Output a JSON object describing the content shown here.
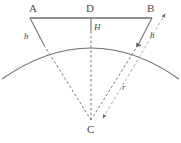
{
  "figure": {
    "type": "geometry-diagram",
    "background_color": "#ffffff",
    "stroke_color": "#6f6f6f",
    "chord_color": "#8a8a8a",
    "dashed_color": "#7a7a7a",
    "radius_arrow_color": "#a9a9a9",
    "text_color": "#4a4a4a"
  },
  "labels": {
    "a": {
      "text": "A",
      "role": "chord-left-endpoint",
      "x": 29,
      "y": 3,
      "style": "upright"
    },
    "d": {
      "text": "D",
      "role": "chord-midpoint",
      "x": 86,
      "y": 3,
      "style": "upright"
    },
    "b": {
      "text": "B",
      "role": "chord-right-endpoint",
      "x": 147,
      "y": 3,
      "style": "upright"
    },
    "h_center": {
      "text": "H",
      "role": "sagitta-height",
      "x": 94,
      "y": 23,
      "style": "italic"
    },
    "h_left": {
      "text": "h",
      "role": "left-offset-height",
      "x": 24,
      "y": 32,
      "style": "italic"
    },
    "h_right": {
      "text": "h",
      "role": "right-offset-height",
      "x": 150,
      "y": 31,
      "style": "italic"
    },
    "r": {
      "text": "r",
      "role": "radius",
      "x": 122,
      "y": 83,
      "style": "italic"
    },
    "c": {
      "text": "C",
      "role": "circle-center",
      "x": 87,
      "y": 124,
      "style": "upright"
    }
  },
  "geometry": {
    "chord": {
      "name": "chord-AB",
      "x1": 30,
      "y1": 18,
      "x2": 152,
      "y2": 18
    },
    "arc": {
      "name": "circular-arc",
      "path": "M 2,79 Q 91,17 179,79",
      "apex_x": 91,
      "apex_y": 30
    },
    "sagitta": {
      "name": "sagitta-DH",
      "x1": 91,
      "y1": 18,
      "x2": 91,
      "y2": 31
    },
    "left_leg": {
      "name": "leg-A-to-arc",
      "x1": 30,
      "y1": 18,
      "x2": 44,
      "y2": 45
    },
    "right_leg": {
      "name": "leg-B-to-arc",
      "x1": 152,
      "y1": 18,
      "x2": 138,
      "y2": 45
    },
    "center": {
      "name": "center-point-C",
      "x": 91,
      "y": 120
    },
    "radii": [
      {
        "name": "radius-left-dashed",
        "x1": 44,
        "y1": 45,
        "x2": 91,
        "y2": 120
      },
      {
        "name": "radius-middle-dashed",
        "x1": 91,
        "y1": 31,
        "x2": 91,
        "y2": 120
      },
      {
        "name": "radius-right-dashed",
        "x1": 138,
        "y1": 45,
        "x2": 91,
        "y2": 120
      }
    ],
    "radius_arrow": {
      "name": "radius-arrow-r",
      "x1": 103,
      "y1": 118,
      "x2": 165,
      "y2": 14
    }
  }
}
